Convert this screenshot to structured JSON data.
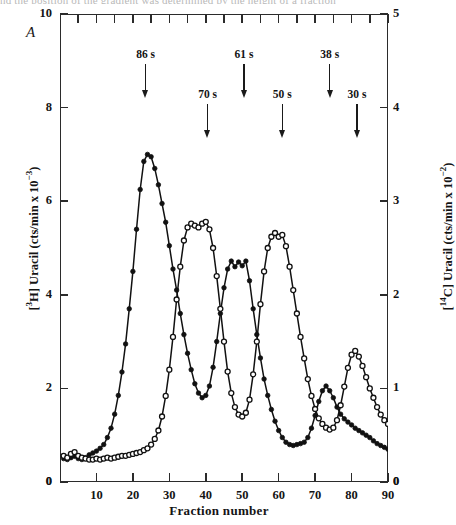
{
  "caption_sliver": "nd the position of the gradient was determined by the height of a fraction",
  "panel_label": "A",
  "axes": {
    "left_title_pre": "[",
    "left_title": "[3H] Uracil (cts/min x 10-3)",
    "right_title": "[14C] Uracil (cts/min x 10-2)",
    "x_title": "Fraction number",
    "left_ticks": [
      "0",
      "2",
      "4",
      "6",
      "8",
      "10"
    ],
    "right_ticks": [
      "0",
      "1",
      "2",
      "3",
      "4",
      "5"
    ],
    "x_ticks": [
      "10",
      "20",
      "30",
      "40",
      "50",
      "60",
      "70",
      "80",
      "90"
    ],
    "x_corner_left": "0",
    "x_corner_right": "0"
  },
  "annotations": [
    {
      "label": "86 s",
      "fraction": 23.5,
      "row": "upper"
    },
    {
      "label": "70 s",
      "fraction": 40.5,
      "row": "lower"
    },
    {
      "label": "61 s",
      "fraction": 50.5,
      "row": "upper"
    },
    {
      "label": "50 s",
      "fraction": 61.0,
      "row": "lower"
    },
    {
      "label": "38 s",
      "fraction": 74.0,
      "row": "upper"
    },
    {
      "label": "30 s",
      "fraction": 81.5,
      "row": "lower"
    }
  ],
  "chart_data": {
    "type": "line",
    "title": "",
    "xlabel": "Fraction number",
    "ylabel": "[3H] Uracil (cts/min x 10-3)",
    "y2label": "[14C] Uracil (cts/min x 10-2)",
    "xlim": [
      1,
      90
    ],
    "ylim": [
      0,
      10
    ],
    "y2lim": [
      0,
      5
    ],
    "grid": false,
    "legend": "none",
    "marker_styles": {
      "filled-circle": "#3H labelled uracil",
      "open-circle": "#14C labelled uracil"
    },
    "series": [
      {
        "name": "[3H] Uracil",
        "marker": "filled-circle",
        "axis": "left",
        "x": [
          1,
          2,
          3,
          4,
          5,
          6,
          7,
          8,
          9,
          10,
          11,
          12,
          13,
          14,
          15,
          16,
          17,
          18,
          19,
          20,
          21,
          22,
          23,
          24,
          25,
          26,
          27,
          28,
          29,
          30,
          31,
          32,
          33,
          34,
          35,
          36,
          37,
          38,
          39,
          40,
          41,
          42,
          43,
          44,
          45,
          46,
          47,
          48,
          49,
          50,
          51,
          52,
          53,
          54,
          55,
          56,
          57,
          58,
          59,
          60,
          61,
          62,
          63,
          64,
          65,
          66,
          67,
          68,
          69,
          70,
          71,
          72,
          73,
          74,
          75,
          76,
          77,
          78,
          79,
          80,
          81,
          82,
          83,
          84,
          85,
          86,
          87,
          88,
          89,
          90
        ],
        "y": [
          0.5,
          0.48,
          0.52,
          0.55,
          0.5,
          0.48,
          0.52,
          0.58,
          0.62,
          0.66,
          0.72,
          0.8,
          0.95,
          1.15,
          1.45,
          1.85,
          2.35,
          2.95,
          3.7,
          4.5,
          5.4,
          6.25,
          6.85,
          7.0,
          6.95,
          6.7,
          6.35,
          5.95,
          5.55,
          5.05,
          4.55,
          4.1,
          3.6,
          3.15,
          2.75,
          2.4,
          2.1,
          1.9,
          1.8,
          1.85,
          2.05,
          2.45,
          3.0,
          3.6,
          4.15,
          4.55,
          4.72,
          4.6,
          4.7,
          4.62,
          4.72,
          4.3,
          3.7,
          3.15,
          2.65,
          2.2,
          1.85,
          1.55,
          1.3,
          1.1,
          0.95,
          0.85,
          0.8,
          0.78,
          0.8,
          0.82,
          0.85,
          0.95,
          1.15,
          1.42,
          1.72,
          1.95,
          2.05,
          1.95,
          1.8,
          1.6,
          1.45,
          1.35,
          1.28,
          1.22,
          1.15,
          1.1,
          1.05,
          1.0,
          0.95,
          0.88,
          0.82,
          0.78,
          0.74,
          0.7
        ]
      },
      {
        "name": "[14C] Uracil",
        "marker": "open-circle",
        "axis": "right",
        "x": [
          1,
          2,
          3,
          4,
          5,
          6,
          7,
          8,
          9,
          10,
          11,
          12,
          13,
          14,
          15,
          16,
          17,
          18,
          19,
          20,
          21,
          22,
          23,
          24,
          25,
          26,
          27,
          28,
          29,
          30,
          31,
          32,
          33,
          34,
          35,
          36,
          37,
          38,
          39,
          40,
          41,
          42,
          43,
          44,
          45,
          46,
          47,
          48,
          49,
          50,
          51,
          52,
          53,
          54,
          55,
          56,
          57,
          58,
          59,
          60,
          61,
          62,
          63,
          64,
          65,
          66,
          67,
          68,
          69,
          70,
          71,
          72,
          73,
          74,
          75,
          76,
          77,
          78,
          79,
          80,
          81,
          82,
          83,
          84,
          85,
          86,
          87,
          88,
          89,
          90
        ],
        "y": [
          0.28,
          0.26,
          0.3,
          0.32,
          0.28,
          0.26,
          0.25,
          0.24,
          0.24,
          0.25,
          0.24,
          0.25,
          0.26,
          0.25,
          0.26,
          0.27,
          0.28,
          0.28,
          0.29,
          0.3,
          0.31,
          0.32,
          0.34,
          0.36,
          0.4,
          0.46,
          0.55,
          0.7,
          0.92,
          1.2,
          1.55,
          1.95,
          2.3,
          2.58,
          2.72,
          2.76,
          2.74,
          2.72,
          2.76,
          2.78,
          2.7,
          2.5,
          2.2,
          1.85,
          1.5,
          1.18,
          0.95,
          0.8,
          0.72,
          0.7,
          0.74,
          0.88,
          1.15,
          1.5,
          1.9,
          2.25,
          2.5,
          2.62,
          2.66,
          2.62,
          2.64,
          2.52,
          2.3,
          2.05,
          1.8,
          1.55,
          1.32,
          1.1,
          0.92,
          0.78,
          0.68,
          0.62,
          0.58,
          0.56,
          0.58,
          0.66,
          0.82,
          1.02,
          1.22,
          1.36,
          1.4,
          1.34,
          1.24,
          1.12,
          1.0,
          0.9,
          0.8,
          0.72,
          0.66,
          0.62
        ]
      }
    ]
  }
}
